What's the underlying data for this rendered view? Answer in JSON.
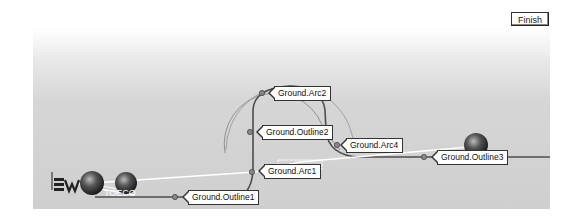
{
  "toolbar": {
    "finish_label": "Finish"
  },
  "viewport": {
    "background_top": "#ffffff",
    "background_bottom": "#cfcfcf",
    "curve_color": "#555555",
    "guide_color": "#ffffff"
  },
  "labels": {
    "arc2": "Ground.Arc2",
    "outline2": "Ground.Outline2",
    "arc4": "Ground.Arc4",
    "outline3": "Ground.Outline3",
    "arc1": "Ground.Arc1",
    "outline1": "Ground.Outline1"
  },
  "icons": {
    "triad": "axis-triad-icon",
    "sphere": "sphere-marker-icon"
  }
}
